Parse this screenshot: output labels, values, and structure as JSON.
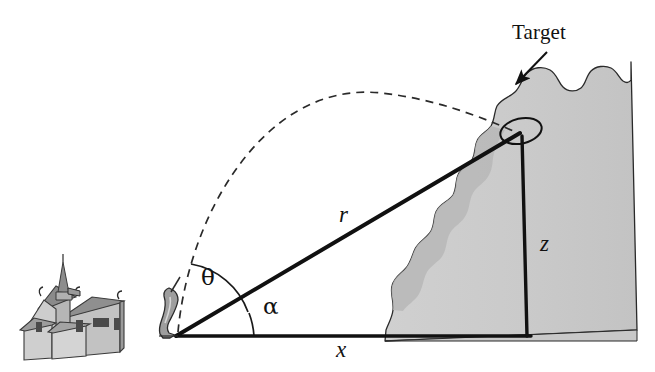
{
  "figure": {
    "title_label": "Target",
    "labels": {
      "target": "Target",
      "range": "r",
      "horizontal": "x",
      "height": "z",
      "launch_angle": "θ",
      "elevation_angle": "α"
    },
    "label_positions": {
      "target": {
        "x": 512,
        "y": 22
      },
      "range": {
        "x": 339,
        "y": 203
      },
      "horizontal": {
        "x": 336,
        "y": 338
      },
      "height": {
        "x": 540,
        "y": 232
      },
      "launch_angle": {
        "x": 201,
        "y": 266
      },
      "elevation_angle": {
        "x": 263,
        "y": 295
      }
    },
    "colors": {
      "stroke": "#111111",
      "background": "#ffffff",
      "hill_fill": "#cccccc",
      "hill_shadow": "#b3b3b3",
      "church_light": "#c6c6c6",
      "church_mid": "#a8a8a8",
      "church_dark": "#8a8a8a",
      "church_roof": "#9a9a9a",
      "cannon_fill": "#9e9e9e"
    },
    "geometry": {
      "origin": {
        "x": 176,
        "y": 336
      },
      "target_point": {
        "x": 518,
        "y": 133
      },
      "baseline_end": {
        "x": 531,
        "y": 336
      },
      "hill_base_left": {
        "x": 385,
        "y": 341
      },
      "hill_base_right": {
        "x": 637,
        "y": 330
      },
      "hill_peak": {
        "x": 631,
        "y": 62
      },
      "trajectory_apex": {
        "x": 380,
        "y": 94
      },
      "theta_arc_radius": 74,
      "alpha_arc_radius": 78,
      "arrow_tail": {
        "x": 547,
        "y": 53
      },
      "arrow_head": {
        "x": 514,
        "y": 86
      }
    },
    "elements": [
      "church-illustration",
      "mortar-cannon",
      "dashed-trajectory",
      "slant-range-line",
      "baseline-x",
      "vertical-z-line",
      "hillside",
      "target-ellipse",
      "target-callout-arrow",
      "theta-arc",
      "alpha-arc"
    ]
  }
}
